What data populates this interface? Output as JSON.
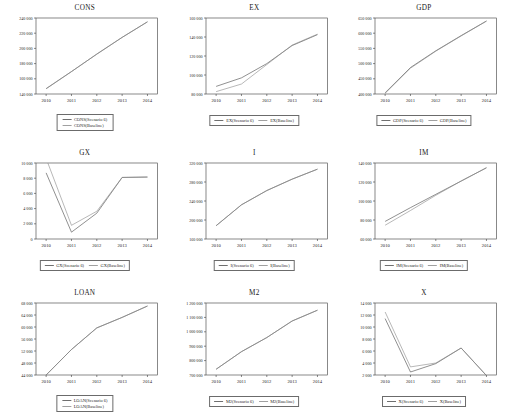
{
  "figure": {
    "panel_order": [
      "CONS",
      "EX",
      "GDP",
      "GX",
      "I",
      "IM",
      "LOAN",
      "M2",
      "X"
    ],
    "legend_scenario_suffix": "(Scenario  6)",
    "legend_baseline_suffix": "(Baseline)"
  },
  "chart_data": [
    {
      "type": "line",
      "title": "CONS",
      "xlabel": "",
      "ylabel": "",
      "x": [
        2010,
        2011,
        2012,
        2013,
        2014
      ],
      "xticks": [
        "2010",
        "2011",
        "2012",
        "2013",
        "2014"
      ],
      "yticks": [
        "140 000",
        "160 000",
        "180 000",
        "200 000",
        "220 000",
        "240 000"
      ],
      "ylim": [
        140000,
        240000
      ],
      "grid": false,
      "legend_position": "below-stacked",
      "series": [
        {
          "name": "CONS(Scenario  6)",
          "values": [
            147000,
            169500,
            192500,
            214500,
            235000
          ]
        },
        {
          "name": "CONS(Baseline)",
          "values": [
            147000,
            169500,
            192500,
            214500,
            235000
          ]
        }
      ]
    },
    {
      "type": "line",
      "title": "EX",
      "xlabel": "",
      "ylabel": "",
      "x": [
        2010,
        2011,
        2012,
        2013,
        2014
      ],
      "xticks": [
        "2010",
        "2011",
        "2012",
        "2013",
        "2014"
      ],
      "yticks": [
        "80 000",
        "100 000",
        "120 000",
        "140 000",
        "160 000"
      ],
      "ylim": [
        80000,
        160000
      ],
      "grid": false,
      "legend_position": "below-inline",
      "series": [
        {
          "name": "EX(Scenario  6)",
          "values": [
            88000,
            97000,
            112000,
            131000,
            142500
          ]
        },
        {
          "name": "EX(Baseline)",
          "values": [
            82500,
            90500,
            111000,
            131500,
            143000
          ]
        }
      ]
    },
    {
      "type": "line",
      "title": "GDP",
      "xlabel": "",
      "ylabel": "",
      "x": [
        2010,
        2011,
        2012,
        2013,
        2014
      ],
      "xticks": [
        "2010",
        "2011",
        "2012",
        "2013",
        "2014"
      ],
      "yticks": [
        "400 000",
        "450 000",
        "500 000",
        "550 000",
        "600 000",
        "650 000"
      ],
      "ylim": [
        400000,
        650000
      ],
      "grid": false,
      "legend_position": "below-inline",
      "series": [
        {
          "name": "GDP(Scenario  6)",
          "values": [
            404000,
            487000,
            542000,
            592000,
            640000
          ]
        },
        {
          "name": "GDP(Baseline)",
          "values": [
            402000,
            485000,
            541000,
            591000,
            640000
          ]
        }
      ]
    },
    {
      "type": "line",
      "title": "GX",
      "xlabel": "",
      "ylabel": "",
      "x": [
        2010,
        2011,
        2012,
        2013,
        2014
      ],
      "xticks": [
        "2010",
        "2011",
        "2012",
        "2013",
        "2014"
      ],
      "yticks": [
        "0",
        "2 000",
        "4 000",
        "6 000",
        "8 000",
        "10 000"
      ],
      "ylim": [
        0,
        10000
      ],
      "grid": false,
      "legend_position": "below-inline",
      "series": [
        {
          "name": "GX(Scenario  6)",
          "values": [
            8700,
            900,
            3400,
            8100,
            8150
          ]
        },
        {
          "name": "GX(Baseline)",
          "values": [
            10600,
            1800,
            3650,
            8100,
            8150
          ]
        }
      ]
    },
    {
      "type": "line",
      "title": "I",
      "xlabel": "",
      "ylabel": "",
      "x": [
        2010,
        2011,
        2012,
        2013,
        2014
      ],
      "xticks": [
        "2010",
        "2011",
        "2012",
        "2013",
        "2014"
      ],
      "yticks": [
        "160 000",
        "200 000",
        "240 000",
        "280 000",
        "320 000"
      ],
      "ylim": [
        160000,
        320000
      ],
      "grid": false,
      "legend_position": "below-inline",
      "series": [
        {
          "name": "I(Scenario  6)",
          "values": [
            188000,
            232000,
            262000,
            286000,
            307000
          ]
        },
        {
          "name": "I(Baseline)",
          "values": [
            188000,
            232000,
            262000,
            286000,
            307000
          ]
        }
      ]
    },
    {
      "type": "line",
      "title": "IM",
      "xlabel": "",
      "ylabel": "",
      "x": [
        2010,
        2011,
        2012,
        2013,
        2014
      ],
      "xticks": [
        "2010",
        "2011",
        "2012",
        "2013",
        "2014"
      ],
      "yticks": [
        "60 000",
        "80 000",
        "100 000",
        "120 000",
        "140 000"
      ],
      "ylim": [
        60000,
        140000
      ],
      "grid": false,
      "legend_position": "below-inline",
      "series": [
        {
          "name": "IM(Scenario  6)",
          "values": [
            78500,
            93000,
            107000,
            121000,
            135000
          ]
        },
        {
          "name": "IM(Baseline)",
          "values": [
            74500,
            90000,
            106000,
            121000,
            135000
          ]
        }
      ]
    },
    {
      "type": "line",
      "title": "LOAN",
      "xlabel": "",
      "ylabel": "",
      "x": [
        2010,
        2011,
        2012,
        2013,
        2014
      ],
      "xticks": [
        "2010",
        "2011",
        "2012",
        "2013",
        "2014"
      ],
      "yticks": [
        "44 000",
        "48 000",
        "52 000",
        "56 000",
        "60 000",
        "64 000",
        "68 000"
      ],
      "ylim": [
        44000,
        68000
      ],
      "grid": false,
      "legend_position": "below-stacked",
      "series": [
        {
          "name": "LOAN(Scenario  6)",
          "values": [
            44000,
            52500,
            59700,
            63200,
            67000
          ]
        },
        {
          "name": "LOAN(Baseline)",
          "values": [
            44000,
            52500,
            59700,
            63200,
            67000
          ]
        }
      ]
    },
    {
      "type": "line",
      "title": "M2",
      "xlabel": "",
      "ylabel": "",
      "x": [
        2010,
        2011,
        2012,
        2013,
        2014
      ],
      "xticks": [
        "2010",
        "2011",
        "2012",
        "2013",
        "2014"
      ],
      "yticks": [
        "700 000",
        "800 000",
        "900 000",
        "1 000 000",
        "1 100 000",
        "1 200 000"
      ],
      "ylim": [
        700000,
        1200000
      ],
      "grid": false,
      "legend_position": "below-inline",
      "series": [
        {
          "name": "M2(Scenario  6)",
          "values": [
            740000,
            862000,
            960000,
            1075000,
            1150000
          ]
        },
        {
          "name": "M2(Baseline)",
          "values": [
            740000,
            862000,
            960000,
            1075000,
            1150000
          ]
        }
      ]
    },
    {
      "type": "line",
      "title": "X",
      "xlabel": "",
      "ylabel": "",
      "x": [
        2010,
        2011,
        2012,
        2013,
        2014
      ],
      "xticks": [
        "2010",
        "2011",
        "2012",
        "2013",
        "2014"
      ],
      "yticks": [
        "2 000",
        "4 000",
        "6 000",
        "8 000",
        "10 000",
        "12 000",
        "14 000"
      ],
      "ylim": [
        2000,
        14000
      ],
      "grid": false,
      "legend_position": "below-inline",
      "series": [
        {
          "name": "X(Scenario  6)",
          "values": [
            11400,
            2500,
            3900,
            6500,
            1900
          ]
        },
        {
          "name": "X(Baseline)",
          "values": [
            12500,
            3350,
            4000,
            6500,
            1900
          ]
        }
      ]
    }
  ]
}
